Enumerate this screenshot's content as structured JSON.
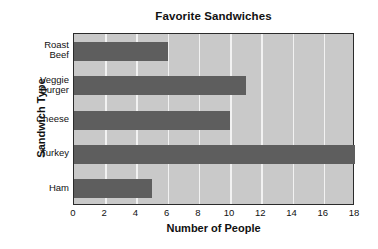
{
  "chart_data": {
    "type": "bar",
    "orientation": "horizontal",
    "title": "Favorite Sandwiches",
    "xlabel": "Number of People",
    "ylabel": "Sandwich Type",
    "categories": [
      "Roast Beef",
      "Veggie Burger",
      "Cheese",
      "Turkey",
      "Ham"
    ],
    "category_lines": [
      [
        "Roast",
        "Beef"
      ],
      [
        "Veggie",
        "Burger"
      ],
      [
        "Cheese"
      ],
      [
        "Turkey"
      ],
      [
        "Ham"
      ]
    ],
    "values": [
      6,
      11,
      10,
      18,
      5
    ],
    "xlim": [
      0,
      18
    ],
    "xticks": [
      0,
      2,
      4,
      6,
      8,
      10,
      12,
      14,
      16,
      18
    ],
    "xtick_labels": [
      "0",
      "2",
      "4",
      "6",
      "8",
      "10",
      "12",
      "14",
      "16",
      "18"
    ],
    "grid": "vertical",
    "legend": "none",
    "colors": {
      "bar": "#5e5e5e",
      "plot_background": "#c9c9c9",
      "gridline": "#f2f2f2",
      "axis_border": "#2b2b2b",
      "text": "#111111",
      "page_background": "#ffffff"
    }
  }
}
